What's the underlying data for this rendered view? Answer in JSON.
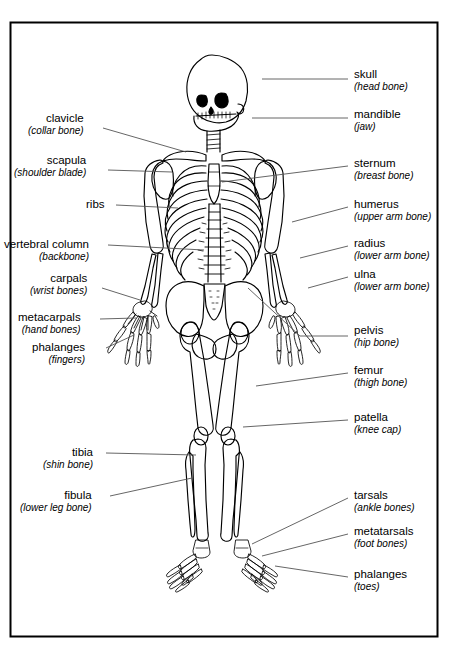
{
  "figure": {
    "frame_color": "#000000",
    "background_color": "#ffffff",
    "line_color": "#000000",
    "leader_color": "#555555"
  },
  "labels_left": [
    {
      "id": "clavicle",
      "term": "clavicle",
      "sub": "(collar bone)",
      "x": 28,
      "y": 112,
      "leader": "M 103 128 L 186 152"
    },
    {
      "id": "scapula",
      "term": "scapula",
      "sub": "(shoulder blade)",
      "x": 14,
      "y": 154,
      "leader": "M 108 170 L 172 172"
    },
    {
      "id": "ribs",
      "term": "ribs",
      "sub": "",
      "x": 86,
      "y": 198,
      "leader": "M 116 205 L 178 208"
    },
    {
      "id": "vertebral-column",
      "term": "vertebral column",
      "sub": "(backbone)",
      "x": 4,
      "y": 238,
      "leader": "M 108 245 L 204 250"
    },
    {
      "id": "carpals",
      "term": "carpals",
      "sub": "(wrist bones)",
      "x": 30,
      "y": 272,
      "leader": "M 102 288 L 140 300"
    },
    {
      "id": "metacarpals",
      "term": "metacarpals",
      "sub": "(hand bones)",
      "x": 18,
      "y": 311,
      "leader": "M 100 319 L 136 318"
    },
    {
      "id": "phalanges-fingers",
      "term": "phalanges",
      "sub": "(fingers)",
      "x": 32,
      "y": 341,
      "leader": "M 106 348 L 134 335"
    },
    {
      "id": "tibia",
      "term": "tibia",
      "sub": "(shin bone)",
      "x": 43,
      "y": 446,
      "leader": "M 106 453 L 196 455"
    },
    {
      "id": "fibula",
      "term": "fibula",
      "sub": "(lower leg bone)",
      "x": 20,
      "y": 489,
      "leader": "M 110 496 L 192 478"
    }
  ],
  "labels_right": [
    {
      "id": "skull",
      "term": "skull",
      "sub": "(head bone)",
      "x": 354,
      "y": 68,
      "leader": "M 262 79 L 348 79"
    },
    {
      "id": "mandible",
      "term": "mandible",
      "sub": "(jaw)",
      "x": 354,
      "y": 108,
      "leader": "M 252 118 L 348 118"
    },
    {
      "id": "sternum",
      "term": "sternum",
      "sub": "(breast bone)",
      "x": 354,
      "y": 157,
      "leader": "M 222 182 L 348 166"
    },
    {
      "id": "humerus",
      "term": "humerus",
      "sub": "(upper arm bone)",
      "x": 354,
      "y": 198,
      "leader": "M 292 222 L 348 207"
    },
    {
      "id": "radius",
      "term": "radius",
      "sub": "(lower arm bone)",
      "x": 354,
      "y": 237,
      "leader": "M 300 258 L 348 246"
    },
    {
      "id": "ulna",
      "term": "ulna",
      "sub": "(lower arm bone)",
      "x": 354,
      "y": 268,
      "leader": "M 308 288 L 348 277"
    },
    {
      "id": "pelvis",
      "term": "pelvis",
      "sub": "(hip bone)",
      "x": 354,
      "y": 324,
      "leader": "M 248 288 L 300 336 L 348 336"
    },
    {
      "id": "femur",
      "term": "femur",
      "sub": "(thigh bone)",
      "x": 354,
      "y": 364,
      "leader": "M 256 386 L 348 373"
    },
    {
      "id": "patella",
      "term": "patella",
      "sub": "(knee cap)",
      "x": 354,
      "y": 411,
      "leader": "M 243 427 L 348 420"
    },
    {
      "id": "tarsals",
      "term": "tarsals",
      "sub": "(ankle bones)",
      "x": 354,
      "y": 489,
      "leader": "M 252 544 L 348 498"
    },
    {
      "id": "metatarsals",
      "term": "metatarsals",
      "sub": "(foot bones)",
      "x": 354,
      "y": 525,
      "leader": "M 262 556 L 348 534"
    },
    {
      "id": "phalanges-toes",
      "term": "phalanges",
      "sub": "(toes)",
      "x": 354,
      "y": 568,
      "leader": "M 275 566 L 348 577"
    }
  ]
}
